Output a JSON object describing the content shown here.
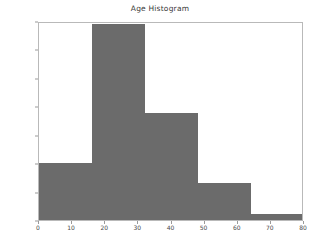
{
  "chart_data": {
    "type": "bar",
    "title": "Age Histogram",
    "xlabel": "",
    "ylabel": "",
    "categories": [
      "0-16",
      "16-32",
      "32-48",
      "48-64",
      "64-80"
    ],
    "bin_edges": [
      0,
      16,
      32,
      48,
      64,
      80
    ],
    "values": [
      100,
      345,
      188,
      65,
      11
    ],
    "xlim": [
      0,
      80
    ],
    "ylim": [
      0,
      350
    ],
    "xticks": [
      0,
      10,
      20,
      30,
      40,
      50,
      60,
      70,
      80
    ],
    "yticks": [
      0,
      50,
      100,
      150,
      200,
      250,
      300,
      350
    ],
    "xtick_labels": [
      "0",
      "10",
      "20",
      "30",
      "40",
      "50",
      "60",
      "70",
      "80"
    ],
    "ytick_labels": [
      "0",
      "50",
      "100",
      "150",
      "200",
      "250",
      "300",
      "350"
    ],
    "grid": false,
    "legend": null,
    "bar_color": "#6b6b6b",
    "frame_color": "#b9b9b9",
    "background": "#ffffff"
  }
}
